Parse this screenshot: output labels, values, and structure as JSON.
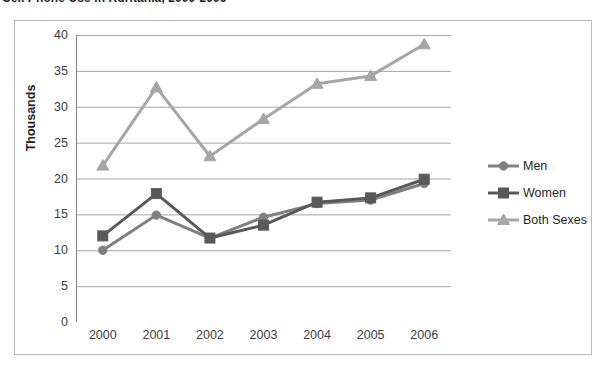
{
  "title": {
    "text": "Cell Phone Use in Ruritania, 2000-2006",
    "clipped": true
  },
  "chart_data": {
    "type": "line",
    "title": "Cell Phone Use in Ruritania, 2000-2006",
    "xlabel": "",
    "ylabel": "Thousands",
    "categories": [
      "2000",
      "2001",
      "2002",
      "2003",
      "2004",
      "2005",
      "2006"
    ],
    "ylim": [
      0,
      40
    ],
    "ytick_labels": [
      "0",
      "5",
      "10",
      "15",
      "20",
      "25",
      "30",
      "35",
      "40"
    ],
    "ytick_values": [
      0,
      5,
      10,
      15,
      20,
      25,
      30,
      35,
      40
    ],
    "grid": true,
    "grid_axis": "y",
    "legend_position": "right",
    "series": [
      {
        "name": "Men",
        "color": "#808080",
        "marker": "circle",
        "values": [
          10.0,
          14.9,
          11.7,
          14.6,
          16.5,
          17.0,
          19.3
        ]
      },
      {
        "name": "Women",
        "color": "#595959",
        "marker": "square",
        "values": [
          12.0,
          17.9,
          11.7,
          13.5,
          16.7,
          17.3,
          19.9
        ]
      },
      {
        "name": "Both Sexes",
        "color": "#a6a6a6",
        "marker": "triangle",
        "values": [
          21.8,
          32.7,
          23.1,
          28.3,
          33.2,
          34.3,
          38.7
        ]
      }
    ]
  },
  "colors": {
    "men": "#808080",
    "women": "#595959",
    "both_sexes": "#a6a6a6",
    "gridline": "#a6a6a6",
    "axis": "#7f7f7f",
    "frame": "#b9b9b9"
  }
}
